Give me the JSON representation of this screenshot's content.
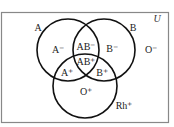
{
  "diagram": {
    "type": "venn",
    "universe_label": "U",
    "sets": [
      {
        "id": "A",
        "label": "A",
        "cx": 68,
        "cy": 50,
        "r": 31
      },
      {
        "id": "B",
        "label": "B",
        "cx": 104,
        "cy": 50,
        "r": 31
      },
      {
        "id": "Rh",
        "label": "Rh⁺",
        "cx": 85,
        "cy": 86,
        "r": 32
      }
    ],
    "regions": {
      "a_neg": "A⁻",
      "ab_neg": "AB⁻",
      "b_neg": "B⁻",
      "o_neg": "O⁻",
      "ab_pos": "AB⁺",
      "a_pos": "A⁺",
      "b_pos": "B⁺",
      "o_pos": "O⁺"
    },
    "set_labels": {
      "a": "A",
      "b": "B",
      "rh": "Rh⁺"
    },
    "colors": {
      "circle_stroke": "#111111",
      "frame_stroke": "#888888",
      "background": "#ffffff"
    }
  }
}
